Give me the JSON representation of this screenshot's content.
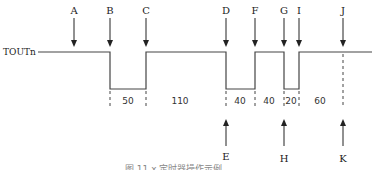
{
  "signal": {
    "name": "TOUTn"
  },
  "top_markers": [
    {
      "label": "A",
      "x": 74
    },
    {
      "label": "B",
      "x": 110
    },
    {
      "label": "C",
      "x": 146
    },
    {
      "label": "D",
      "x": 226
    },
    {
      "label": "F",
      "x": 255
    },
    {
      "label": "G",
      "x": 284
    },
    {
      "label": "I",
      "x": 299
    },
    {
      "label": "J",
      "x": 343
    }
  ],
  "bottom_markers": [
    {
      "label": "E",
      "x": 226
    },
    {
      "label": "H",
      "x": 284
    },
    {
      "label": "K",
      "x": 343
    }
  ],
  "durations": [
    {
      "value": "50",
      "x": 128
    },
    {
      "value": "110",
      "x": 180
    },
    {
      "value": "40",
      "x": 240
    },
    {
      "value": "40",
      "x": 269
    },
    {
      "value": "20",
      "x": 291
    },
    {
      "value": "60",
      "x": 320
    }
  ],
  "caption": "图 11.x 定时器操作示例"
}
